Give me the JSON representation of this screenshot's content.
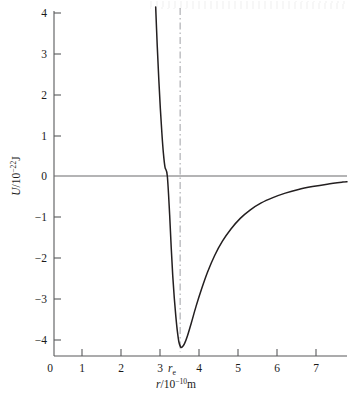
{
  "figure": {
    "background_color": "#ffffff",
    "curve_color": "#231f20",
    "axis_color": "#58595b",
    "guide_color": "#a8a9ad"
  },
  "chart_data": {
    "type": "line",
    "title": "",
    "subtitle": "",
    "xlabel": "r/10−10m",
    "xlabel_parts": {
      "symbol": "r",
      "divider": "/10",
      "exponent": "−10",
      "unit": "m"
    },
    "ylabel": "U/10−22J",
    "ylabel_parts": {
      "symbol": "U",
      "divider": "/10",
      "exponent": "−22",
      "unit": "J"
    },
    "xlim": [
      0,
      7.55
    ],
    "ylim": [
      -4.4,
      4.15
    ],
    "xticks": [
      0,
      1,
      2,
      3,
      4,
      5,
      6,
      7
    ],
    "xticklabels": [
      "0",
      "1",
      "2",
      "3",
      "4",
      "5",
      "6",
      "7"
    ],
    "yticks": [
      4,
      3,
      2,
      1,
      0,
      -1,
      -2,
      -3,
      -4
    ],
    "yticklabels": [
      "4",
      "3",
      "2",
      "1",
      "0",
      "−1",
      "−2",
      "−3",
      "−4"
    ],
    "grid": false,
    "legend": null,
    "annotations": [
      {
        "name": "equilibrium-separation",
        "label": "re",
        "label_symbol": "r",
        "label_sub": "e",
        "x": 3.25,
        "y": -4.4,
        "kind": "axis-annotation"
      },
      {
        "name": "equilibrium-guide-line",
        "kind": "vertical-dash-dot",
        "x": 3.25,
        "y_from": -4.2,
        "y_to": 4.15
      },
      {
        "name": "zero-energy-line",
        "kind": "horizontal",
        "y": 0,
        "x_from": 0,
        "x_to": 7.55
      }
    ],
    "series": [
      {
        "name": "Lennard-Jones potential U(r)",
        "well_depth": -4.2,
        "equilibrium_r": 3.25,
        "zero_crossing_r": 2.92,
        "asymptote": -0.14,
        "points": [
          [
            2.62,
            4.15
          ],
          [
            2.66,
            3.2
          ],
          [
            2.7,
            2.38
          ],
          [
            2.74,
            1.66
          ],
          [
            2.78,
            1.05
          ],
          [
            2.82,
            0.55
          ],
          [
            2.86,
            0.22
          ],
          [
            2.92,
            0.0
          ],
          [
            2.98,
            -0.95
          ],
          [
            3.02,
            -1.75
          ],
          [
            3.06,
            -2.45
          ],
          [
            3.1,
            -3.0
          ],
          [
            3.14,
            -3.45
          ],
          [
            3.18,
            -3.82
          ],
          [
            3.22,
            -4.08
          ],
          [
            3.26,
            -4.19
          ],
          [
            3.3,
            -4.2
          ],
          [
            3.36,
            -4.12
          ],
          [
            3.44,
            -3.92
          ],
          [
            3.54,
            -3.6
          ],
          [
            3.66,
            -3.2
          ],
          [
            3.8,
            -2.78
          ],
          [
            3.96,
            -2.35
          ],
          [
            4.14,
            -1.95
          ],
          [
            4.34,
            -1.6
          ],
          [
            4.56,
            -1.3
          ],
          [
            4.8,
            -1.04
          ],
          [
            5.06,
            -0.83
          ],
          [
            5.34,
            -0.66
          ],
          [
            5.64,
            -0.53
          ],
          [
            5.96,
            -0.42
          ],
          [
            6.3,
            -0.33
          ],
          [
            6.66,
            -0.26
          ],
          [
            7.04,
            -0.2
          ],
          [
            7.44,
            -0.15
          ],
          [
            7.55,
            -0.14
          ]
        ]
      }
    ]
  }
}
